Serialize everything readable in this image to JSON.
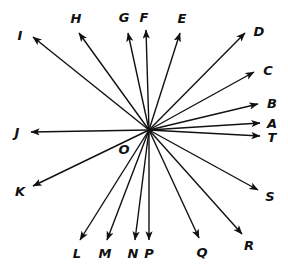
{
  "figure": {
    "type": "vector-ray-diagram",
    "background_color": "#ffffff",
    "stroke_color": "#111111",
    "stroke_width": 1.4,
    "width": 288,
    "height": 279,
    "origin": {
      "label": "O",
      "x": 149,
      "y": 130,
      "label_x": 124,
      "label_y": 149
    },
    "vectors": [
      {
        "label": "A",
        "tip_x": 260,
        "tip_y": 123,
        "label_x": 272,
        "label_y": 123
      },
      {
        "label": "B",
        "tip_x": 258,
        "tip_y": 104,
        "label_x": 272,
        "label_y": 103
      },
      {
        "label": "C",
        "tip_x": 254,
        "tip_y": 72,
        "label_x": 268,
        "label_y": 70
      },
      {
        "label": "D",
        "tip_x": 245,
        "tip_y": 33,
        "label_x": 259,
        "label_y": 31
      },
      {
        "label": "E",
        "tip_x": 180,
        "tip_y": 33,
        "label_x": 182,
        "label_y": 18
      },
      {
        "label": "F",
        "tip_x": 146,
        "tip_y": 30,
        "label_x": 144,
        "label_y": 17
      },
      {
        "label": "G",
        "tip_x": 128,
        "tip_y": 33,
        "label_x": 124,
        "label_y": 17
      },
      {
        "label": "H",
        "tip_x": 79,
        "tip_y": 33,
        "label_x": 76,
        "label_y": 18
      },
      {
        "label": "I",
        "tip_x": 33,
        "tip_y": 37,
        "label_x": 20,
        "label_y": 35
      },
      {
        "label": "J",
        "tip_x": 31,
        "tip_y": 132,
        "label_x": 17,
        "label_y": 132
      },
      {
        "label": "K",
        "tip_x": 33,
        "tip_y": 186,
        "label_x": 20,
        "label_y": 191
      },
      {
        "label": "L",
        "tip_x": 80,
        "tip_y": 240,
        "label_x": 77,
        "label_y": 253
      },
      {
        "label": "M",
        "tip_x": 107,
        "tip_y": 240,
        "label_x": 105,
        "label_y": 253
      },
      {
        "label": "N",
        "tip_x": 135,
        "tip_y": 240,
        "label_x": 133,
        "label_y": 253
      },
      {
        "label": "P",
        "tip_x": 149,
        "tip_y": 240,
        "label_x": 149,
        "label_y": 253
      },
      {
        "label": "Q",
        "tip_x": 199,
        "tip_y": 238,
        "label_x": 202,
        "label_y": 252
      },
      {
        "label": "R",
        "tip_x": 242,
        "tip_y": 234,
        "label_x": 249,
        "label_y": 245
      },
      {
        "label": "S",
        "tip_x": 258,
        "tip_y": 190,
        "label_x": 270,
        "label_y": 196
      },
      {
        "label": "T",
        "tip_x": 260,
        "tip_y": 136,
        "label_x": 272,
        "label_y": 137
      }
    ]
  }
}
